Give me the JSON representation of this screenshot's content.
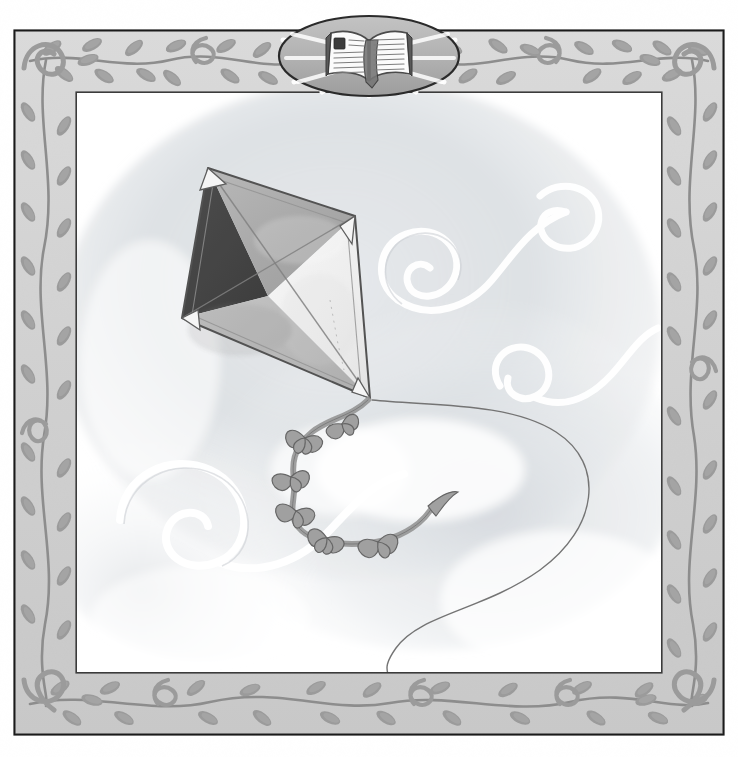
{
  "artwork": {
    "title": "Kite with Flower Tail",
    "medium": "Grayscale watercolor and pencil illustration",
    "subject": "A diamond kite flying in a breezy sky with a ribbon-flower tail",
    "caption": "",
    "canvas": {
      "width": 738,
      "height": 757,
      "background": "#ffffff"
    }
  },
  "frame": {
    "name": "decorative-vine-border",
    "outer_rect": {
      "x": 14,
      "y": 30,
      "width": 710,
      "height": 705
    },
    "band_width": 62,
    "band_fill": "#d2d2d2",
    "outline_color": "#1a1a1a",
    "vine_color": "#9a9a9a",
    "vine_stem_color": "#8d8d8d",
    "inner_panel": {
      "x": 76,
      "y": 92,
      "width": 586,
      "height": 581,
      "fill": "#ffffff"
    },
    "motifs": [
      "leaf-sprig",
      "spiral-curl",
      "stem-vine"
    ],
    "corner_motif": "spiral-curl"
  },
  "medallion": {
    "name": "open-book-medallion",
    "center": {
      "x": 369,
      "y": 56
    },
    "oval": {
      "rx": 90,
      "ry": 40
    },
    "oval_fill": "#b4b4b4",
    "oval_stroke": "#2a2a2a",
    "ray_color": "#ffffff",
    "ray_count": 12,
    "icon": "open-book-icon",
    "book_page_fill": "#fbfbfb",
    "book_line_color": "#7d7d7d",
    "book_spine_color": "#6d6d6d",
    "book_cover_color": "#5a5a5a",
    "bookmark_color": "#3c3c3c"
  },
  "sky": {
    "name": "sky-wash",
    "base": "#ffffff",
    "wash_tint": "#cfd2d6",
    "wash_tint_2": "#c2c7cd",
    "cloud_highlight": "#ffffff",
    "swirls": [
      {
        "id": "swirl-upper-left",
        "cx": 432,
        "cy": 268,
        "r": 46,
        "turns": 1.9
      },
      {
        "id": "swirl-upper-right",
        "cx": 576,
        "cy": 224,
        "r": 40,
        "turns": 1.8
      },
      {
        "id": "swirl-mid-right",
        "cx": 530,
        "cy": 360,
        "r": 34,
        "turns": 1.7
      },
      {
        "id": "swirl-lower-left",
        "cx": 192,
        "cy": 520,
        "r": 52,
        "turns": 2.1
      }
    ]
  },
  "kite": {
    "name": "diamond-kite",
    "vertices": {
      "top": {
        "x": 208,
        "y": 168
      },
      "right": {
        "x": 355,
        "y": 216
      },
      "bottom": {
        "x": 370,
        "y": 398
      },
      "left": {
        "x": 182,
        "y": 318
      }
    },
    "spar_center": {
      "x": 268,
      "y": 296
    },
    "panels": [
      {
        "id": "panel-top-left",
        "label": "dark",
        "fill": "#3d3d3d"
      },
      {
        "id": "panel-top-right",
        "label": "medium-gray",
        "fill": "#a9a9a9"
      },
      {
        "id": "panel-bottom-right",
        "label": "light",
        "fill": "#efefef"
      },
      {
        "id": "panel-bottom-left",
        "label": "mid-light",
        "fill": "#b9b9b9"
      }
    ],
    "outline_color": "#4a4a4a",
    "corner_patch_fill": "#f5f5f5",
    "corner_patch_stroke": "#555555",
    "spar_color": "#6a6a6a"
  },
  "tail": {
    "name": "kite-tail",
    "ribbon_color": "#8f8f8f",
    "ribbon_stroke": "#6e6e6e",
    "bow_fill": "#9b9b9b",
    "bow_stroke": "#5e5e5e",
    "bow_count": 6,
    "bows": [
      {
        "x": 303,
        "y": 437
      },
      {
        "x": 289,
        "y": 475
      },
      {
        "x": 294,
        "y": 508
      },
      {
        "x": 325,
        "y": 536
      },
      {
        "x": 374,
        "y": 540
      },
      {
        "x": 340,
        "y": 424
      }
    ]
  },
  "string": {
    "name": "kite-string",
    "color": "#6d6d6d",
    "width": 1.3,
    "start": {
      "x": 372,
      "y": 400
    },
    "end": {
      "x": 388,
      "y": 672
    },
    "description": "Long S-curved line sweeping right then down to lower center"
  }
}
